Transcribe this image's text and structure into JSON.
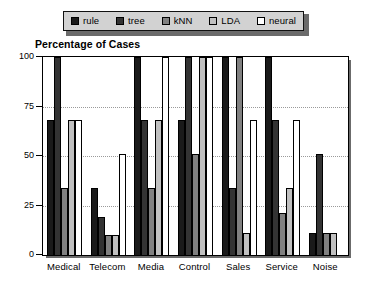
{
  "chart_data": {
    "type": "bar",
    "title": "Percentage of Cases",
    "xlabel": "",
    "ylabel": "",
    "ylim": [
      0,
      100
    ],
    "yticks": [
      0,
      25,
      50,
      75,
      100
    ],
    "ytick_labels": [
      "0",
      "25",
      "50",
      "75",
      "100"
    ],
    "grid": true,
    "legend_position": "top",
    "categories": [
      "Medical",
      "Telecom",
      "Media",
      "Control",
      "Sales",
      "Service",
      "Noise"
    ],
    "series": [
      {
        "name": "rule",
        "color": "#1a1a1a",
        "values": [
          68,
          34,
          100,
          68,
          100,
          100,
          11
        ]
      },
      {
        "name": "tree",
        "color": "#333333",
        "values": [
          100,
          19,
          68,
          100,
          34,
          68,
          51
        ]
      },
      {
        "name": "kNN",
        "color": "#808080",
        "values": [
          34,
          10,
          34,
          51,
          100,
          21,
          11
        ]
      },
      {
        "name": "LDA",
        "color": "#c0c0c0",
        "values": [
          68,
          10,
          68,
          100,
          11,
          34,
          11
        ]
      },
      {
        "name": "neural",
        "color": "#ffffff",
        "values": [
          68,
          51,
          100,
          100,
          68,
          68,
          0
        ]
      }
    ]
  },
  "legend": {
    "items": [
      {
        "label": "rule",
        "swatch": "#1a1a1a"
      },
      {
        "label": "tree",
        "swatch": "#333333"
      },
      {
        "label": "kNN",
        "swatch": "#808080"
      },
      {
        "label": "LDA",
        "swatch": "#c0c0c0"
      },
      {
        "label": "neural",
        "swatch": "#ffffff"
      }
    ]
  }
}
